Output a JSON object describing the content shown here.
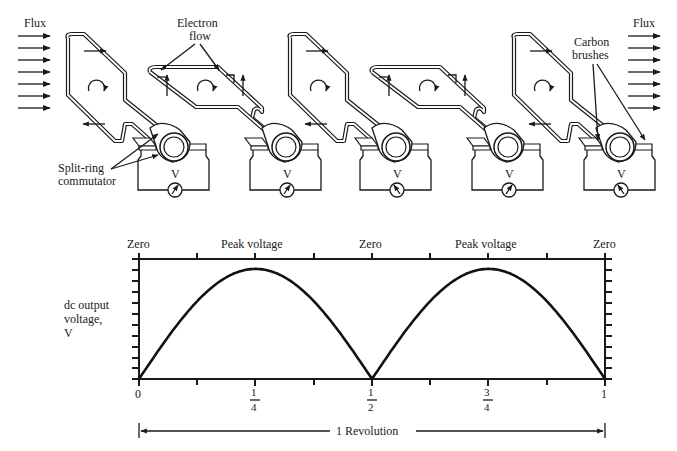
{
  "diagram": {
    "flux_left_label": "Flux",
    "flux_right_label": "Flux",
    "electron_flow_label_line1": "Electron",
    "electron_flow_label_line2": "flow",
    "carbon_brushes_label_line1": "Carbon",
    "carbon_brushes_label_line2": "brushes",
    "commutator_label_line1": "Split-ring",
    "commutator_label_line2": "commutator",
    "voltmeter_label": "V",
    "stages": [
      {
        "position": "vertical",
        "coil_orientation": "face-on",
        "meter_needle": "left"
      },
      {
        "position": "horizontal",
        "coil_orientation": "edge-on",
        "meter_needle": "left"
      },
      {
        "position": "vertical",
        "coil_orientation": "face-on",
        "meter_needle": "right"
      },
      {
        "position": "horizontal",
        "coil_orientation": "edge-on",
        "meter_needle": "right"
      },
      {
        "position": "vertical",
        "coil_orientation": "face-on",
        "meter_needle": "left"
      }
    ]
  },
  "chart_data": {
    "type": "line",
    "title": "",
    "ylabel": "dc output voltage, V",
    "ylabel_lines": [
      "dc output",
      "voltage,",
      "V"
    ],
    "xlabel": "1 Revolution",
    "top_labels": [
      "Zero",
      "Peak voltage",
      "Zero",
      "Peak voltage",
      "Zero"
    ],
    "x_ticks": [
      "0",
      "1/4",
      "1/2",
      "3/4",
      "1"
    ],
    "x_tick_fractions": [
      {
        "num": "",
        "den": "",
        "whole": "0"
      },
      {
        "num": "1",
        "den": "4",
        "whole": ""
      },
      {
        "num": "1",
        "den": "2",
        "whole": ""
      },
      {
        "num": "3",
        "den": "4",
        "whole": ""
      },
      {
        "num": "",
        "den": "",
        "whole": "1"
      }
    ],
    "x": [
      0,
      0.0625,
      0.125,
      0.1875,
      0.25,
      0.3125,
      0.375,
      0.4375,
      0.5,
      0.5625,
      0.625,
      0.6875,
      0.75,
      0.8125,
      0.875,
      0.9375,
      1
    ],
    "series": [
      {
        "name": "dc output voltage (rectified)",
        "values": [
          0,
          0.38,
          0.71,
          0.92,
          1.0,
          0.92,
          0.71,
          0.38,
          0,
          0.38,
          0.71,
          0.92,
          1.0,
          0.92,
          0.71,
          0.38,
          0
        ]
      }
    ],
    "xlim": [
      0,
      1
    ],
    "ylim": [
      0,
      1.09
    ],
    "grid": false,
    "legend": "none",
    "y_tick_count": 11
  }
}
